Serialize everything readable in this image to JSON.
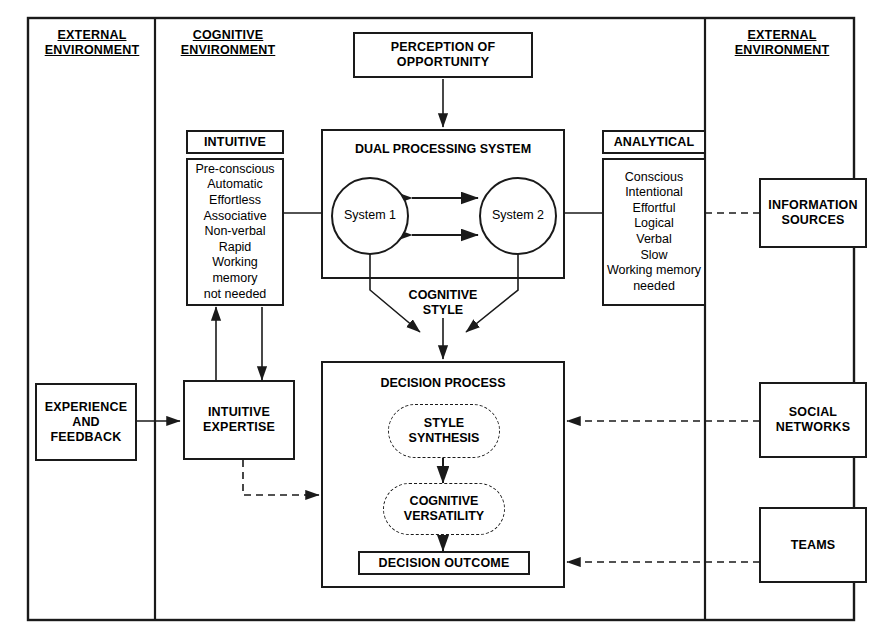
{
  "diagram": {
    "columns": {
      "left_header": "EXTERNAL\nENVIRONMENT",
      "left_header_line1": "EXTERNAL",
      "left_header_line2": "ENVIRONMENT",
      "middle_header_line1": "COGNITIVE",
      "middle_header_line2": "ENVIRONMENT",
      "right_header_line1": "EXTERNAL",
      "right_header_line2": "ENVIRONMENT"
    },
    "nodes": {
      "perception": {
        "line1": "PERCEPTION OF",
        "line2": "OPPORTUNITY"
      },
      "intuitive_title": "INTUITIVE",
      "intuitive_traits": "Pre-conscious\nAutomatic\nEffortless\nAssociative\nNon-verbal\nRapid\nWorking memory\nnot needed",
      "analytical_title": "ANALYTICAL",
      "analytical_traits": "Conscious\nIntentional\nEffortful\nLogical\nVerbal\nSlow\nWorking memory\nneeded",
      "dual_processing_system": "DUAL PROCESSING SYSTEM",
      "system1": "System 1",
      "system2": "System 2",
      "cognitive_style_line1": "COGNITIVE",
      "cognitive_style_line2": "STYLE",
      "decision_process": "DECISION PROCESS",
      "style_synthesis_line1": "STYLE",
      "style_synthesis_line2": "SYNTHESIS",
      "cognitive_versatility_line1": "COGNITIVE",
      "cognitive_versatility_line2": "VERSATILITY",
      "decision_outcome": "DECISION OUTCOME",
      "experience_feedback_line1": "EXPERIENCE",
      "experience_feedback_line2": "AND",
      "experience_feedback_line3": "FEEDBACK",
      "intuitive_expertise_line1": "INTUITIVE",
      "intuitive_expertise_line2": "EXPERTISE",
      "information_sources_line1": "INFORMATION",
      "information_sources_line2": "SOURCES",
      "social_networks_line1": "SOCIAL",
      "social_networks_line2": "NETWORKS",
      "teams": "TEAMS"
    },
    "colors": {
      "stroke": "#1a1a1a",
      "background": "#ffffff",
      "text": "#000000"
    }
  }
}
